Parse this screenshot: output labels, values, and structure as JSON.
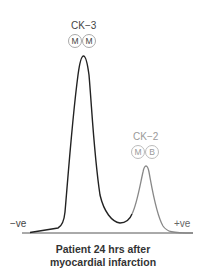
{
  "peaks": [
    {
      "name": "CK-3",
      "label": "CK−3",
      "subunits": [
        "M",
        "M"
      ],
      "color": "#222222",
      "label_color": "#444444"
    },
    {
      "name": "CK-2",
      "label": "CK−2",
      "subunits": [
        "M",
        "B"
      ],
      "color": "#888888",
      "label_color": "#9a9a9a"
    }
  ],
  "axis": {
    "left_label": "−ve",
    "right_label": "+ve"
  },
  "caption": {
    "line1": "Patient 24 hrs after",
    "line2": "myocardial infarction"
  }
}
